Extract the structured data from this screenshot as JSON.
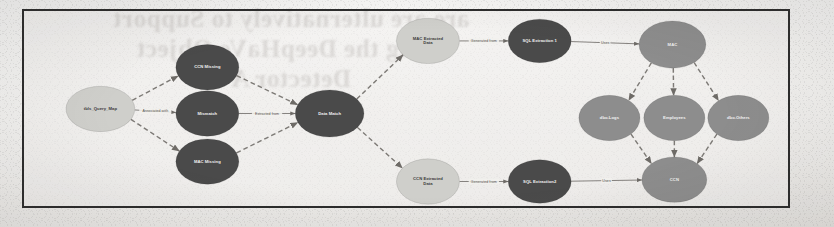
{
  "page": {
    "width": 834,
    "height": 227,
    "background_color": "#fbfbfa",
    "paper_color": "#f1f0ed",
    "frame_color": "#2c2c2c"
  },
  "bleed_through_text": "are are ulternatively to Support\nusing the DeepHaVe Object\nDetector A",
  "diagram": {
    "type": "knowledge-graph",
    "palette": {
      "dark_node": "#4a4a4a",
      "medium_node": "#8d8d8d",
      "light_node": "#cfcfcb",
      "edge": "#7d7a76",
      "label_on_dark": "#f2f2f2",
      "label_on_light": "#3a3a3a"
    },
    "nodes": [
      {
        "id": "table_query_map",
        "label": "tbls_Query_Map",
        "cx": 80,
        "cy": 108,
        "rx": 36,
        "ry": 25,
        "shade": "light",
        "label_lines": [
          "tbls_Query_Map"
        ]
      },
      {
        "id": "ccn_missing",
        "label": "CCN Missing",
        "cx": 192,
        "cy": 62,
        "rx": 33,
        "ry": 25,
        "shade": "dark",
        "label_lines": [
          "CCN Missing"
        ]
      },
      {
        "id": "mismatch",
        "label": "Mismatch",
        "cx": 192,
        "cy": 113,
        "rx": 33,
        "ry": 25,
        "shade": "dark",
        "label_lines": [
          "Mismatch"
        ]
      },
      {
        "id": "mac_missing",
        "label": "MAC Missing",
        "cx": 192,
        "cy": 166,
        "rx": 33,
        "ry": 25,
        "shade": "dark",
        "label_lines": [
          "MAC Missing"
        ]
      },
      {
        "id": "data_match",
        "label": "Data Match",
        "cx": 320,
        "cy": 113,
        "rx": 36,
        "ry": 26,
        "shade": "dark",
        "label_lines": [
          "Data Match"
        ]
      },
      {
        "id": "mac_extracted",
        "label": "MAC Extracted Data",
        "cx": 423,
        "cy": 33,
        "rx": 33,
        "ry": 25,
        "shade": "light",
        "label_lines": [
          "MAC Extracted",
          "Data"
        ]
      },
      {
        "id": "ccn_extracted",
        "label": "CCN Extracted Data",
        "cx": 423,
        "cy": 188,
        "rx": 33,
        "ry": 25,
        "shade": "light",
        "label_lines": [
          "CCN Extracted",
          "Data"
        ]
      },
      {
        "id": "sql_extraction1",
        "label": "SQL Extraction 1",
        "cx": 540,
        "cy": 33,
        "rx": 33,
        "ry": 24,
        "shade": "dark",
        "label_lines": [
          "SQL Extraction 1"
        ]
      },
      {
        "id": "sql_extraction2",
        "label": "SQL Extraction2",
        "cx": 540,
        "cy": 188,
        "rx": 33,
        "ry": 24,
        "shade": "dark",
        "label_lines": [
          "SQL Extraction2"
        ]
      },
      {
        "id": "mac",
        "label": "MAC",
        "cx": 679,
        "cy": 37,
        "rx": 35,
        "ry": 26,
        "shade": "medium",
        "label_lines": [
          "MAC"
        ]
      },
      {
        "id": "dbo_logs",
        "label": "dbo.Logs",
        "cx": 613,
        "cy": 118,
        "rx": 32,
        "ry": 25,
        "shade": "medium",
        "label_lines": [
          "dbo.Logs"
        ]
      },
      {
        "id": "employees",
        "label": "Employees",
        "cx": 681,
        "cy": 118,
        "rx": 32,
        "ry": 25,
        "shade": "medium",
        "label_lines": [
          "Employees"
        ]
      },
      {
        "id": "dbo_others",
        "label": "dbo.Others",
        "cx": 748,
        "cy": 118,
        "rx": 32,
        "ry": 25,
        "shade": "medium",
        "label_lines": [
          "dbo.Others"
        ]
      },
      {
        "id": "ccn",
        "label": "CCN",
        "cx": 681,
        "cy": 186,
        "rx": 34,
        "ry": 25,
        "shade": "medium",
        "label_lines": [
          "CCN"
        ]
      }
    ],
    "edges": [
      {
        "from": "table_query_map",
        "to": "ccn_missing",
        "label": "",
        "style": "dashed",
        "arrow": true
      },
      {
        "from": "table_query_map",
        "to": "mismatch",
        "label": "Associated with",
        "style": "solid",
        "arrow": true
      },
      {
        "from": "table_query_map",
        "to": "mac_missing",
        "label": "",
        "style": "dashed",
        "arrow": true
      },
      {
        "from": "ccn_missing",
        "to": "data_match",
        "label": "",
        "style": "dashed",
        "arrow": true
      },
      {
        "from": "mismatch",
        "to": "data_match",
        "label": "Extracted from",
        "style": "solid",
        "arrow": true
      },
      {
        "from": "mac_missing",
        "to": "data_match",
        "label": "",
        "style": "dashed",
        "arrow": true
      },
      {
        "from": "data_match",
        "to": "mac_extracted",
        "label": "",
        "style": "dashed",
        "arrow": true
      },
      {
        "from": "data_match",
        "to": "ccn_extracted",
        "label": "",
        "style": "dashed",
        "arrow": true
      },
      {
        "from": "mac_extracted",
        "to": "sql_extraction1",
        "label": "Generated from",
        "style": "solid",
        "arrow": true
      },
      {
        "from": "ccn_extracted",
        "to": "sql_extraction2",
        "label": "Generated from",
        "style": "solid",
        "arrow": true
      },
      {
        "from": "sql_extraction1",
        "to": "mac",
        "label": "Uses",
        "style": "solid",
        "arrow": true
      },
      {
        "from": "sql_extraction2",
        "to": "ccn",
        "label": "Uses",
        "style": "solid",
        "arrow": true
      },
      {
        "from": "mac",
        "to": "dbo_logs",
        "label": "",
        "style": "dashed",
        "arrow": true
      },
      {
        "from": "mac",
        "to": "employees",
        "label": "",
        "style": "dashed",
        "arrow": true
      },
      {
        "from": "mac",
        "to": "dbo_others",
        "label": "",
        "style": "dashed",
        "arrow": true
      },
      {
        "from": "dbo_logs",
        "to": "ccn",
        "label": "",
        "style": "dashed",
        "arrow": true
      },
      {
        "from": "employees",
        "to": "ccn",
        "label": "",
        "style": "dashed",
        "arrow": true
      },
      {
        "from": "dbo_others",
        "to": "ccn",
        "label": "",
        "style": "dashed",
        "arrow": true
      }
    ]
  }
}
